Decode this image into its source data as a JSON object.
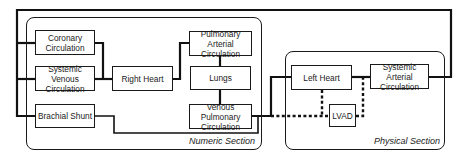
{
  "diagram": {
    "sections": {
      "numeric": {
        "label": "Numeric Section"
      },
      "physical": {
        "label": "Physical Section"
      }
    },
    "blocks": {
      "coronary": {
        "line1": "Coronary",
        "line2": "Circulation"
      },
      "systemic_venous": {
        "line1": "Systemic Venous",
        "line2": "Circulation"
      },
      "brachial_shunt": {
        "label": "Brachial Shunt"
      },
      "right_heart": {
        "label": "Right Heart"
      },
      "pulmonary_arterial": {
        "line1": "Pulmonary Arterial",
        "line2": "Circulation"
      },
      "lungs": {
        "label": "Lungs"
      },
      "venous_pulmonary": {
        "line1": "Venous Pulmonary",
        "line2": "Circulation"
      },
      "left_heart": {
        "label": "Left Heart"
      },
      "lvad": {
        "label": "LVAD"
      },
      "systemic_arterial": {
        "line1": "Systemic Arterial",
        "line2": "Circulation"
      }
    },
    "connections": [
      {
        "from": "systemic_arterial",
        "to": "coronary",
        "style": "solid"
      },
      {
        "from": "systemic_arterial",
        "to": "systemic_venous",
        "style": "solid"
      },
      {
        "from": "systemic_arterial",
        "to": "brachial_shunt",
        "style": "solid"
      },
      {
        "from": "coronary",
        "to": "right_heart",
        "style": "solid"
      },
      {
        "from": "systemic_venous",
        "to": "right_heart",
        "style": "solid"
      },
      {
        "from": "right_heart",
        "to": "pulmonary_arterial",
        "style": "solid"
      },
      {
        "from": "pulmonary_arterial",
        "to": "lungs",
        "style": "solid"
      },
      {
        "from": "lungs",
        "to": "venous_pulmonary",
        "style": "solid"
      },
      {
        "from": "brachial_shunt",
        "to": "venous_pulmonary",
        "style": "solid"
      },
      {
        "from": "venous_pulmonary",
        "to": "left_heart",
        "style": "solid"
      },
      {
        "from": "left_heart",
        "to": "systemic_arterial",
        "style": "solid"
      },
      {
        "from": "venous_pulmonary",
        "to": "lvad",
        "style": "dotted"
      },
      {
        "from": "left_heart",
        "to": "lvad",
        "style": "dotted"
      },
      {
        "from": "lvad",
        "to": "systemic_arterial",
        "style": "dotted"
      }
    ]
  }
}
